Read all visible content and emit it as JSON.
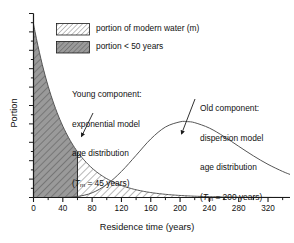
{
  "chart_data": {
    "type": "area",
    "title": "",
    "xlabel": "Residence time (years)",
    "ylabel": "Portion",
    "xlim": [
      0,
      350
    ],
    "ylim": [
      0,
      1.06
    ],
    "xticks": [
      0,
      40,
      80,
      120,
      160,
      200,
      240,
      280,
      320
    ],
    "xtick_labels": [
      "0",
      "40",
      "80",
      "120",
      "160",
      "200",
      "240",
      "280",
      "320"
    ],
    "xminor_step": 20,
    "yticks_visible": false,
    "yminor_count": 20,
    "grid": false,
    "legend_position": "top-left-inside",
    "series": [
      {
        "name": "Young component: exponential model age distribution",
        "model": "exponential",
        "mean_transit_time_years": 45,
        "fill": "hatch-light",
        "split_at_years": 60,
        "split_fill": "hatch-dark",
        "x": [
          0,
          10,
          20,
          30,
          40,
          50,
          60,
          70,
          80,
          90,
          100,
          120,
          140,
          160,
          180,
          200,
          220,
          240,
          260,
          280,
          300,
          320,
          340,
          350
        ],
        "y": [
          1.0,
          0.801,
          0.641,
          0.513,
          0.411,
          0.329,
          0.264,
          0.211,
          0.169,
          0.135,
          0.108,
          0.069,
          0.044,
          0.029,
          0.018,
          0.012,
          0.0074,
          0.0047,
          0.003,
          0.0019,
          0.0012,
          0.0008,
          0.0005,
          0.0004
        ]
      },
      {
        "name": "Old component: dispersion model age distribution",
        "model": "dispersion",
        "mean_transit_time_years": 200,
        "fill": "none",
        "x": [
          0,
          20,
          40,
          60,
          80,
          100,
          120,
          140,
          160,
          180,
          200,
          210,
          220,
          240,
          260,
          280,
          300,
          320,
          340,
          350
        ],
        "y": [
          0.0,
          0.0,
          0.001,
          0.006,
          0.027,
          0.075,
          0.15,
          0.243,
          0.337,
          0.406,
          0.436,
          0.437,
          0.431,
          0.4,
          0.351,
          0.295,
          0.24,
          0.191,
          0.15,
          0.133
        ]
      }
    ],
    "annotations": [
      {
        "name": "young-component-annotation",
        "lines": [
          "Young component:",
          "exponential model",
          "age distribution",
          "(Tm = 45 years)"
        ],
        "line4_prefix": "(",
        "line4_symbol": "T",
        "line4_subscript": "m",
        "line4_suffix": " = 45 years)",
        "pointer_to_years": 63,
        "pointer_to_portion": 0.252
      },
      {
        "name": "old-component-annotation",
        "lines": [
          "Old component:",
          "dispersion model",
          "age distribution",
          "(Tm = 200 years)"
        ],
        "line4_prefix": "(",
        "line4_symbol": "T",
        "line4_subscript": "m",
        "line4_suffix": " = 200 years)",
        "pointer_to_years": 208,
        "pointer_to_portion": 0.436
      }
    ]
  },
  "legend": {
    "items": [
      {
        "label": "portion of modern water (m)",
        "swatch": "hatch-light",
        "swatch_bg": "#ffffff"
      },
      {
        "label": "portion < 50 years",
        "swatch": "hatch-dark",
        "swatch_bg": "#9a9a9a"
      }
    ]
  },
  "colors": {
    "axis": "#1a1a1a",
    "curve": "#555555",
    "hatch_line": "#5a5a5a",
    "dark_fill": "#9a9a9a",
    "light_fill": "#ffffff",
    "background": "#ffffff",
    "text": "#1a1a1a"
  }
}
